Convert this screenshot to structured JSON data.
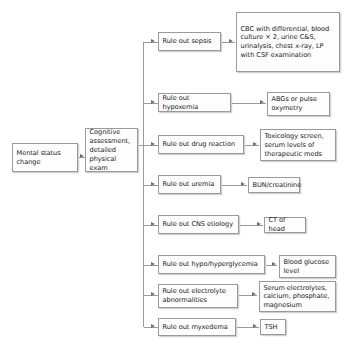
{
  "diagram": {
    "colors": {
      "box_border": "#9a9a9a",
      "box_fill": "#fdfdfd",
      "text": "#1a1a1a",
      "connector": "#9a9a9a",
      "arrowhead": "#6f6f6f"
    },
    "start": {
      "label": "Mental status change"
    },
    "assessment": {
      "label": "Cognitive assessment, detailed physical exam"
    },
    "branches": [
      {
        "step": "Rule out sepsis",
        "result": "CBC with differential, blood culture × 2, urine C&S, urinalysis, chest x-ray, LP with CSF examination"
      },
      {
        "step": "Rule out hypoxemia",
        "result": "ABGs or pulse oxymetry"
      },
      {
        "step": "Rule out drug reaction",
        "result": "Toxicology screen, serum levels of therapeutic meds"
      },
      {
        "step": "Rule out uremia",
        "result": "BUN/creatinine"
      },
      {
        "step": "Rule out CNS etiology",
        "result": "CT of head"
      },
      {
        "step": "Rule out hypo/hyperglycemia",
        "result": "Blood glucose level"
      },
      {
        "step": "Rule out electrolyte abnormalities",
        "result": "Serum electrolytes, calcium, phosphate, magnesium"
      },
      {
        "step": "Rule out myxedema",
        "result": "TSH"
      }
    ]
  }
}
